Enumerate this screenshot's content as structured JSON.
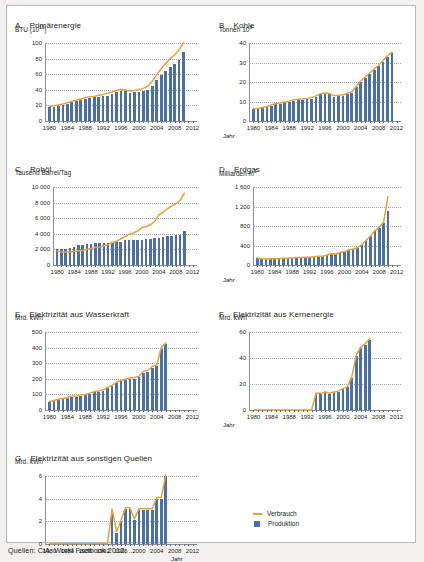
{
  "legend": {
    "consumption_label": "Verbrauch",
    "production_label": "Produktion"
  },
  "axis": {
    "x_axis_label": "Jahr"
  },
  "source_note": "Quellen: CIA, World Factbook 2012; ...",
  "chart_data": [
    {
      "id": "A",
      "type": "bar",
      "letter": "A",
      "title": "Primärenergie",
      "ylabel": "BTU (10",
      "ylabel_sup": "15",
      "ylabel_tail": ")",
      "xlabel": "",
      "ylim": [
        0,
        100
      ],
      "yticks": [
        0,
        20,
        40,
        60,
        80,
        100
      ],
      "ytick_labels": [
        "0",
        "20",
        "40",
        "60",
        "80",
        "100"
      ],
      "xlim": [
        1979,
        2013
      ],
      "xticks": [
        1980,
        1984,
        1988,
        1992,
        1996,
        2000,
        2004,
        2008,
        2012
      ],
      "xtick_labels": [
        "1980",
        "1984",
        "1988",
        "1992",
        "1996",
        "2000",
        "2004",
        "2008",
        "2012"
      ],
      "x": [
        1980,
        1981,
        1982,
        1983,
        1984,
        1985,
        1986,
        1987,
        1988,
        1989,
        1990,
        1991,
        1992,
        1993,
        1994,
        1995,
        1996,
        1997,
        1998,
        1999,
        2000,
        2001,
        2002,
        2003,
        2004,
        2005,
        2006,
        2007,
        2008,
        2009,
        2010
      ],
      "series": [
        {
          "name": "Produktion",
          "kind": "bar",
          "color": "#4c6fa5",
          "values": [
            17.5,
            18.3,
            19.5,
            20.6,
            22.4,
            24.1,
            25.1,
            26.6,
            28.0,
            29.1,
            30.3,
            30.8,
            31.6,
            32.4,
            34.4,
            36.7,
            38.5,
            38.2,
            36.5,
            36.9,
            37.2,
            38.6,
            40.2,
            45.3,
            52.6,
            59.4,
            64.4,
            69.2,
            73.2,
            78.2,
            89.0
          ]
        },
        {
          "name": "Verbrauch",
          "kind": "line",
          "color": "#e2a33f",
          "values": [
            19.0,
            19.5,
            20.6,
            21.8,
            23.4,
            25.2,
            26.5,
            28.1,
            29.8,
            31.0,
            31.5,
            32.9,
            34.1,
            35.7,
            37.2,
            39.3,
            40.3,
            39.7,
            38.4,
            39.1,
            40.2,
            41.8,
            44.8,
            51.3,
            59.5,
            67.2,
            73.8,
            80.0,
            84.6,
            91.3,
            100.5
          ]
        }
      ]
    },
    {
      "id": "B",
      "type": "bar",
      "letter": "B",
      "title": "Kohle",
      "ylabel": "Tonnen 10",
      "ylabel_sup": "8",
      "ylabel_tail": "",
      "ylim": [
        0,
        40
      ],
      "yticks": [
        0,
        10,
        20,
        30,
        40
      ],
      "ytick_labels": [
        "0",
        "10",
        "20",
        "30",
        "40"
      ],
      "xlim": [
        1979,
        2013
      ],
      "xticks": [
        1980,
        1984,
        1988,
        1992,
        1996,
        2000,
        2004,
        2008,
        2012
      ],
      "xtick_labels": [
        "1980",
        "1984",
        "1988",
        "1992",
        "1996",
        "2000",
        "2004",
        "2008",
        "2012"
      ],
      "x": [
        1980,
        1981,
        1982,
        1983,
        1984,
        1985,
        1986,
        1987,
        1988,
        1989,
        1990,
        1991,
        1992,
        1993,
        1994,
        1995,
        1996,
        1997,
        1998,
        1999,
        2000,
        2001,
        2002,
        2003,
        2004,
        2005,
        2006,
        2007,
        2008,
        2009,
        2010,
        2011
      ],
      "series": [
        {
          "name": "Produktion",
          "kind": "bar",
          "color": "#4c6fa5",
          "values": [
            6.2,
            6.2,
            6.7,
            7.2,
            7.9,
            8.7,
            8.9,
            9.3,
            9.8,
            10.5,
            10.8,
            10.9,
            11.2,
            11.5,
            12.4,
            13.6,
            14.0,
            13.7,
            12.5,
            12.8,
            12.9,
            13.8,
            14.5,
            17.3,
            20.0,
            22.0,
            24.0,
            26.0,
            28.0,
            30.5,
            33.0,
            34.7
          ]
        },
        {
          "name": "Verbrauch",
          "kind": "line",
          "color": "#e2a33f",
          "values": [
            6.4,
            6.4,
            6.9,
            7.4,
            8.2,
            9.0,
            9.2,
            9.7,
            10.2,
            10.9,
            11.1,
            11.3,
            11.6,
            12.0,
            12.9,
            14.0,
            14.4,
            14.1,
            12.9,
            13.2,
            13.3,
            14.2,
            15.0,
            17.8,
            20.5,
            22.6,
            24.6,
            26.6,
            28.6,
            31.0,
            33.6,
            35.3
          ]
        }
      ]
    },
    {
      "id": "C",
      "type": "bar",
      "letter": "C",
      "title": "Rohöl",
      "ylabel": "Tausend Barrel/Tag",
      "ylabel_sup": "",
      "ylabel_tail": "",
      "ylim": [
        0,
        10000
      ],
      "yticks": [
        0,
        2000,
        4000,
        6000,
        8000,
        10000
      ],
      "ytick_labels": [
        "0",
        "2 000",
        "4 000",
        "6 000",
        "8 000",
        "10 000"
      ],
      "xlim": [
        1979,
        2013
      ],
      "xticks": [
        1980,
        1984,
        1988,
        1992,
        1996,
        2000,
        2004,
        2008,
        2012
      ],
      "xtick_labels": [
        "1980",
        "1984",
        "1988",
        "1992",
        "1996",
        "2000",
        "2004",
        "2008",
        "2012"
      ],
      "x": [
        1980,
        1981,
        1982,
        1983,
        1984,
        1985,
        1986,
        1987,
        1988,
        1989,
        1990,
        1991,
        1992,
        1993,
        1994,
        1995,
        1996,
        1997,
        1998,
        1999,
        2000,
        2001,
        2002,
        2003,
        2004,
        2005,
        2006,
        2007,
        2008,
        2009,
        2010
      ],
      "series": [
        {
          "name": "Produktion",
          "kind": "bar",
          "color": "#4c6fa5",
          "values": [
            2114,
            2022,
            2045,
            2120,
            2296,
            2505,
            2620,
            2690,
            2730,
            2760,
            2774,
            2828,
            2840,
            2890,
            2930,
            2990,
            3170,
            3210,
            3210,
            3210,
            3250,
            3300,
            3390,
            3410,
            3490,
            3630,
            3680,
            3740,
            3800,
            3790,
            4310
          ]
        },
        {
          "name": "Verbrauch",
          "kind": "line",
          "color": "#e2a33f",
          "values": [
            1765,
            1700,
            1660,
            1690,
            1740,
            1820,
            1890,
            2000,
            2120,
            2260,
            2300,
            2440,
            2610,
            2890,
            3040,
            3360,
            3600,
            3950,
            4100,
            4360,
            4800,
            4900,
            5160,
            5580,
            6440,
            6790,
            7200,
            7580,
            7850,
            8300,
            9200
          ]
        }
      ]
    },
    {
      "id": "D",
      "type": "bar",
      "letter": "D",
      "title": "Erdgas",
      "ylabel": "Milliarden m",
      "ylabel_sup": "3",
      "ylabel_tail": "",
      "ylim": [
        0,
        1600
      ],
      "yticks": [
        0,
        400,
        800,
        1200,
        1600
      ],
      "ytick_labels": [
        "0",
        "400",
        "800",
        "1 200",
        "1 600"
      ],
      "xlim": [
        1979,
        2013
      ],
      "xticks": [
        1980,
        1984,
        1988,
        1992,
        1996,
        2000,
        2004,
        2008,
        2012
      ],
      "xtick_labels": [
        "1980",
        "1984",
        "1988",
        "1992",
        "1996",
        "2000",
        "2004",
        "2008",
        "2012"
      ],
      "x": [
        1980,
        1981,
        1982,
        1983,
        1984,
        1985,
        1986,
        1987,
        1988,
        1989,
        1990,
        1991,
        1992,
        1993,
        1994,
        1995,
        1996,
        1997,
        1998,
        1999,
        2000,
        2001,
        2002,
        2003,
        2004,
        2005,
        2006,
        2007,
        2008,
        2009,
        2010
      ],
      "series": [
        {
          "name": "Produktion",
          "kind": "bar",
          "color": "#4c6fa5",
          "values": [
            142,
            127,
            120,
            124,
            124,
            129,
            138,
            139,
            143,
            150,
            153,
            156,
            158,
            167,
            176,
            179,
            201,
            227,
            223,
            252,
            272,
            303,
            327,
            350,
            415,
            500,
            586,
            693,
            761,
            852,
            1100
          ]
        },
        {
          "name": "Verbrauch",
          "kind": "line",
          "color": "#e2a33f",
          "values": [
            145,
            130,
            123,
            127,
            127,
            132,
            141,
            142,
            146,
            153,
            156,
            159,
            161,
            170,
            179,
            182,
            204,
            230,
            226,
            255,
            275,
            306,
            330,
            354,
            420,
            508,
            595,
            705,
            775,
            875,
            1400
          ]
        }
      ]
    },
    {
      "id": "E",
      "type": "bar",
      "letter": "E",
      "title": "Elektrizität aus Wasserkraft",
      "ylabel": "Mrd. kWh",
      "ylabel_sup": "",
      "ylabel_tail": "",
      "ylim": [
        0,
        500
      ],
      "yticks": [
        0,
        100,
        200,
        300,
        400,
        500
      ],
      "ytick_labels": [
        "0",
        "100",
        "200",
        "300",
        "400",
        "500"
      ],
      "xlim": [
        1979,
        2013
      ],
      "xticks": [
        1980,
        1984,
        1988,
        1992,
        1996,
        2000,
        2004,
        2008,
        2012
      ],
      "xtick_labels": [
        "1980",
        "1984",
        "1988",
        "1992",
        "1996",
        "2000",
        "2004",
        "2008",
        "2012"
      ],
      "x": [
        1980,
        1981,
        1982,
        1983,
        1984,
        1985,
        1986,
        1987,
        1988,
        1989,
        1990,
        1991,
        1992,
        1993,
        1994,
        1995,
        1996,
        1997,
        1998,
        1999,
        2000,
        2001,
        2002,
        2003,
        2004,
        2005,
        2006
      ],
      "series": [
        {
          "name": "Produktion",
          "kind": "bar",
          "color": "#4c6fa5",
          "values": [
            52,
            58,
            66,
            71,
            75,
            85,
            85,
            93,
            95,
            104,
            114,
            118,
            124,
            140,
            154,
            171,
            184,
            190,
            200,
            200,
            210,
            240,
            245,
            270,
            280,
            390,
            425
          ]
        },
        {
          "name": "Verbrauch",
          "kind": "line",
          "color": "#e2a33f",
          "values": [
            55,
            61,
            69,
            74,
            79,
            89,
            89,
            97,
            99,
            108,
            118,
            122,
            129,
            145,
            160,
            177,
            190,
            197,
            207,
            207,
            217,
            248,
            253,
            279,
            290,
            400,
            430
          ]
        }
      ]
    },
    {
      "id": "F",
      "type": "bar",
      "letter": "F",
      "title": "Elektrizität aus Kernenergie",
      "ylabel": "Mrd. kWh",
      "ylabel_sup": "",
      "ylabel_tail": "",
      "ylim": [
        0,
        60
      ],
      "yticks": [
        0,
        20,
        40,
        60
      ],
      "ytick_labels": [
        "0",
        "20",
        "40",
        "60"
      ],
      "xlim": [
        1979,
        2013
      ],
      "xticks": [
        1980,
        1984,
        1988,
        1992,
        1996,
        2000,
        2004,
        2008,
        2012
      ],
      "xtick_labels": [
        "1980",
        "1984",
        "1988",
        "1992",
        "1996",
        "2000",
        "2004",
        "2008",
        "2012"
      ],
      "x": [
        1980,
        1981,
        1982,
        1983,
        1984,
        1985,
        1986,
        1987,
        1988,
        1989,
        1990,
        1991,
        1992,
        1993,
        1994,
        1995,
        1996,
        1997,
        1998,
        1999,
        2000,
        2001,
        2002,
        2003,
        2004,
        2005,
        2006
      ],
      "series": [
        {
          "name": "Produktion",
          "kind": "bar",
          "color": "#4c6fa5",
          "values": [
            0,
            0,
            0,
            0,
            0,
            0,
            0,
            0,
            0,
            0,
            0,
            0,
            0,
            0,
            12.6,
            12.4,
            13.4,
            12.5,
            13.5,
            14.1,
            16.0,
            17.4,
            25.0,
            41.6,
            47.8,
            50.3,
            54.0
          ]
        },
        {
          "name": "Verbrauch",
          "kind": "line",
          "color": "#e2a33f",
          "values": [
            0,
            0,
            0,
            0,
            0,
            0,
            0,
            0,
            0,
            0,
            0,
            0,
            0,
            0,
            13.0,
            12.8,
            13.8,
            12.9,
            13.9,
            14.5,
            16.4,
            17.8,
            25.5,
            42.2,
            48.4,
            51.0,
            55.0
          ]
        }
      ]
    },
    {
      "id": "G",
      "type": "bar",
      "letter": "G",
      "title": "Elektrizität aus sonstigen Quellen",
      "ylabel": "Mrd. kWh",
      "ylabel_sup": "",
      "ylabel_tail": "",
      "ylim": [
        0,
        6
      ],
      "yticks": [
        0,
        2,
        4,
        6
      ],
      "ytick_labels": [
        "0",
        "2",
        "4",
        "6"
      ],
      "xlim": [
        1979,
        2013
      ],
      "xticks": [
        1980,
        1984,
        1988,
        1992,
        1996,
        2000,
        2004,
        2008,
        2012
      ],
      "xtick_labels": [
        "1980",
        "1984",
        "1988",
        "1992",
        "1996",
        "2000",
        "2004",
        "2008",
        "2012"
      ],
      "x": [
        1980,
        1981,
        1982,
        1983,
        1984,
        1985,
        1986,
        1987,
        1988,
        1989,
        1990,
        1991,
        1992,
        1993,
        1994,
        1995,
        1996,
        1997,
        1998,
        1999,
        2000,
        2001,
        2002,
        2003,
        2004,
        2005,
        2006
      ],
      "series": [
        {
          "name": "Produktion",
          "kind": "bar",
          "color": "#4c6fa5",
          "values": [
            0,
            0,
            0,
            0,
            0,
            0,
            0,
            0,
            0,
            0,
            0,
            0,
            0,
            0,
            3.0,
            1.0,
            2.0,
            3.1,
            3.1,
            2.1,
            3.0,
            3.0,
            3.0,
            3.0,
            4.0,
            4.0,
            6.0
          ]
        },
        {
          "name": "Verbrauch",
          "kind": "line",
          "color": "#e2a33f",
          "values": [
            0.02,
            0.02,
            0.02,
            0.02,
            0.02,
            0.02,
            0.02,
            0.02,
            0.02,
            0.02,
            0.02,
            0.02,
            0.02,
            0.05,
            3.1,
            1.1,
            2.1,
            3.2,
            3.2,
            2.2,
            3.1,
            3.1,
            3.1,
            3.1,
            4.1,
            4.1,
            6.1
          ]
        }
      ]
    }
  ]
}
